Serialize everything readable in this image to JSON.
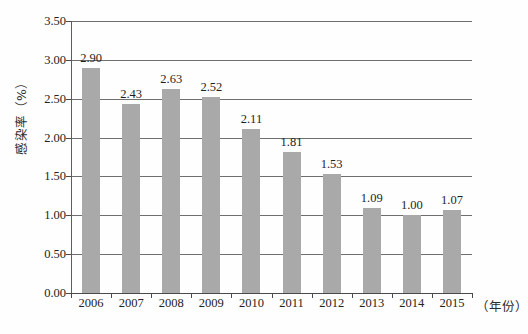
{
  "chart_data": {
    "type": "bar",
    "title": "",
    "xlabel": "（年份）",
    "ylabel": "感染率（%）",
    "categories": [
      "2006",
      "2007",
      "2008",
      "2009",
      "2010",
      "2011",
      "2012",
      "2013",
      "2014",
      "2015"
    ],
    "values": [
      2.9,
      2.43,
      2.63,
      2.52,
      2.11,
      1.81,
      1.53,
      1.09,
      1.0,
      1.07
    ],
    "value_labels": [
      "2.90",
      "2.43",
      "2.63",
      "2.52",
      "2.11",
      "1.81",
      "1.53",
      "1.09",
      "1.00",
      "1.07"
    ],
    "ylim": [
      0.0,
      3.5
    ],
    "ytick_values": [
      0.0,
      0.5,
      1.0,
      1.5,
      2.0,
      2.5,
      3.0,
      3.5
    ],
    "ytick_labels": [
      "0.00",
      "0.50",
      "1.00",
      "1.50",
      "2.00",
      "2.50",
      "3.00",
      "3.50"
    ],
    "grid": true,
    "legend": "none",
    "series_name": "感染率",
    "bar_color": "#a9a9a9",
    "grid_color": "#6f6f6f",
    "axis_color": "#4a4a4a",
    "background_color": "#ffffff",
    "text_color": "#232323"
  }
}
